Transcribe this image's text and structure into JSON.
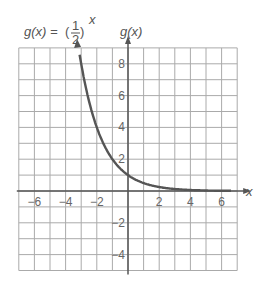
{
  "chart_data": {
    "type": "line",
    "title_parts": {
      "lhs": "g(x) =",
      "num": "1",
      "den": "2",
      "exp": "x"
    },
    "xlabel": "x",
    "ylabel": "g(x)",
    "xlim": [
      -7,
      7
    ],
    "ylim": [
      -5,
      9
    ],
    "grid": true,
    "x_ticks": [
      -6,
      -4,
      -2,
      2,
      4,
      6
    ],
    "y_ticks": [
      -4,
      -2,
      2,
      4,
      6,
      8
    ],
    "x_tick_labels": [
      "−6",
      "−4",
      "−2",
      "2",
      "4",
      "6"
    ],
    "y_tick_labels": [
      "−4",
      "−2",
      "2",
      "4",
      "6",
      "8"
    ],
    "series": [
      {
        "name": "g(x) = (1/2)^x",
        "x": [
          -3.15,
          -3,
          -2.5,
          -2,
          -1.5,
          -1,
          -0.5,
          0,
          0.5,
          1,
          1.5,
          2,
          3,
          4,
          5,
          6,
          6.6
        ],
        "y": [
          8.88,
          8,
          5.66,
          4,
          2.83,
          2,
          1.41,
          1,
          0.71,
          0.5,
          0.35,
          0.25,
          0.125,
          0.0625,
          0.031,
          0.016,
          0.01
        ]
      }
    ],
    "colors": {
      "curve": "#555555",
      "grid": "#aaaaaa",
      "axis": "#555555",
      "text": "#666666"
    }
  }
}
